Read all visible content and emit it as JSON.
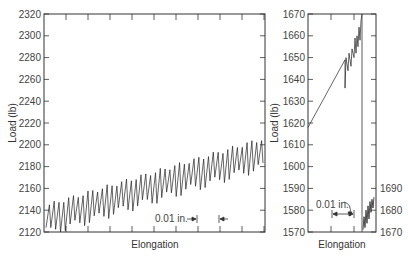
{
  "chart_data": [
    {
      "type": "line",
      "panel": "left",
      "title": "",
      "xlabel": "Elongation",
      "ylabel": "Load (lb)",
      "ylim": [
        2120,
        2320
      ],
      "yticks": [
        2120,
        2140,
        2160,
        2180,
        2200,
        2220,
        2240,
        2260,
        2280,
        2300,
        2320
      ],
      "grid": false,
      "annotation": "0.01 in.",
      "series": [
        {
          "name": "serrated load trace",
          "description": "Sawtooth oscillation (~45 cycles) with peaks rising from ~2145 to ~2205 and troughs rising from ~2120 to ~2180",
          "peak_start": 2145,
          "peak_end": 2205,
          "trough_start": 2120,
          "trough_end": 2180,
          "cycles": 45
        }
      ]
    },
    {
      "type": "line",
      "panel": "right",
      "title": "",
      "xlabel": "Elongation",
      "ylabel": "Load (lb)",
      "ylim": [
        1570,
        1670
      ],
      "yticks": [
        1570,
        1580,
        1590,
        1600,
        1610,
        1620,
        1630,
        1640,
        1650,
        1660,
        1670
      ],
      "right_axis_ticks": [
        1670,
        1680,
        1690
      ],
      "grid": false,
      "annotation": "0.01 in.",
      "series": [
        {
          "name": "rising load with serrations",
          "description": "Linear rise from ~1618 to ~1670 with small serrations between 1636 and 1670, then drop to bottom; continuation on right axis scale 1670-1690",
          "start": 1618,
          "end": 1670,
          "serration_start": 1648,
          "continuation_right_axis": [
            1670,
            1686
          ]
        }
      ]
    }
  ],
  "left_chart": {
    "ylabel": "Load (lb)",
    "xlabel": "Elongation",
    "yticks": [
      "2120",
      "2140",
      "2160",
      "2180",
      "2200",
      "2220",
      "2240",
      "2260",
      "2280",
      "2300",
      "2320"
    ],
    "annotation": "0.01 in."
  },
  "right_chart": {
    "ylabel": "Load (lb)",
    "xlabel": "Elongation",
    "yticks": [
      "1570",
      "1580",
      "1590",
      "1600",
      "1610",
      "1620",
      "1630",
      "1640",
      "1650",
      "1660",
      "1670"
    ],
    "right_ticks": [
      "1670",
      "1680",
      "1690"
    ],
    "annotation": "0.01 in."
  }
}
